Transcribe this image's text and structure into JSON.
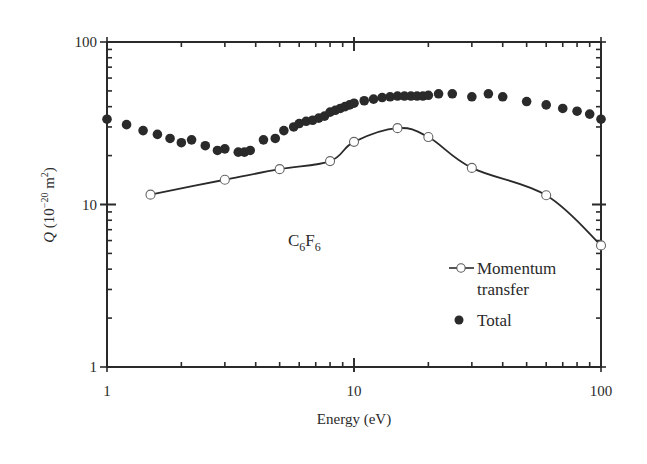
{
  "chart_data": {
    "type": "line",
    "title": "",
    "annotation": "C6F6",
    "annotation_parts": {
      "c": "C",
      "c_sub": "6",
      "f": "F",
      "f_sub": "6"
    },
    "xlabel": "Energy (eV)",
    "ylabel": "Q (10^-20 m^2)",
    "ylabel_parts": {
      "q": "Q",
      "open": " (10",
      "exp": "−20",
      "mid": " m",
      "sq": "2",
      "close": ")"
    },
    "xscale": "log",
    "yscale": "log",
    "xlim": [
      1,
      100
    ],
    "ylim": [
      1,
      100
    ],
    "x_ticks": [
      "1",
      "10",
      "100"
    ],
    "y_ticks": [
      "1",
      "10",
      "100"
    ],
    "grid": false,
    "legend_position": "lower right (inside)",
    "series": [
      {
        "name": "Momentum transfer",
        "marker": "open-circle",
        "line": "solid smooth",
        "x": [
          1.5,
          3.0,
          5.0,
          8.0,
          10.0,
          15.0,
          20.0,
          30.0,
          60.0,
          100.0
        ],
        "y": [
          11.5,
          14.2,
          16.5,
          18.5,
          24.3,
          29.5,
          26.0,
          16.8,
          11.4,
          5.6
        ]
      },
      {
        "name": "Total",
        "marker": "filled-circle",
        "line": "none",
        "x": [
          1.0,
          1.2,
          1.4,
          1.6,
          1.8,
          2.0,
          2.2,
          2.5,
          2.8,
          3.0,
          3.4,
          3.6,
          3.8,
          4.3,
          4.8,
          5.2,
          5.7,
          6.0,
          6.4,
          6.8,
          7.2,
          7.6,
          8.0,
          8.4,
          8.8,
          9.2,
          9.6,
          10.0,
          11.0,
          12.0,
          13.0,
          14.0,
          15.0,
          16.0,
          17.0,
          18.0,
          19.0,
          20.0,
          22.0,
          25.0,
          30.0,
          35.0,
          40.0,
          50.0,
          60.0,
          70.0,
          80.0,
          90.0,
          100.0
        ],
        "y": [
          33.5,
          31.0,
          28.5,
          27.0,
          25.5,
          24.0,
          25.0,
          23.0,
          21.5,
          22.0,
          21.0,
          21.0,
          21.5,
          25.0,
          25.5,
          28.5,
          30.0,
          31.5,
          32.5,
          33.0,
          34.0,
          35.0,
          37.0,
          38.0,
          39.0,
          40.0,
          41.0,
          42.0,
          43.5,
          44.5,
          45.5,
          46.0,
          46.5,
          46.5,
          46.5,
          46.5,
          46.5,
          47.0,
          48.0,
          48.0,
          46.0,
          48.0,
          46.0,
          43.0,
          41.0,
          39.0,
          37.5,
          36.0,
          33.5
        ]
      }
    ]
  },
  "legend": {
    "momentum_line1": "Momentum",
    "momentum_line2": "transfer",
    "total": "Total"
  }
}
